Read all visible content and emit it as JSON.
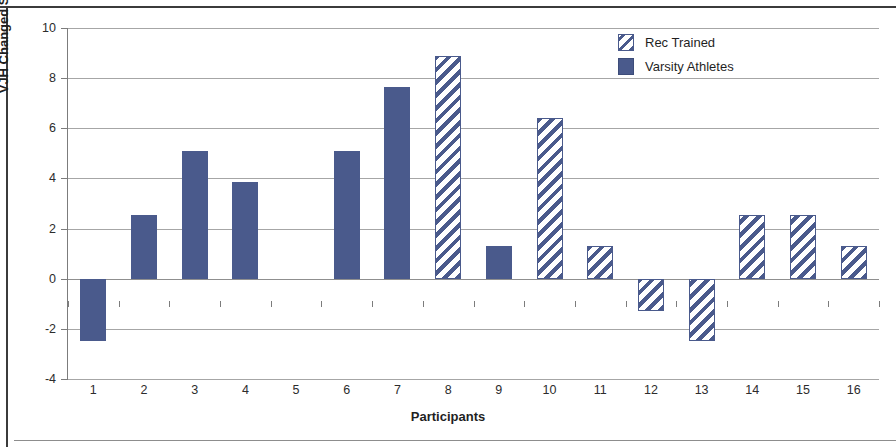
{
  "chart_data": {
    "type": "bar",
    "title": "",
    "xlabel": "Participants",
    "ylabel": "VJH Changed Scores (cm)",
    "categories": [
      "1",
      "2",
      "3",
      "4",
      "5",
      "6",
      "7",
      "8",
      "9",
      "10",
      "11",
      "12",
      "13",
      "14",
      "15",
      "16"
    ],
    "values": [
      -2.5,
      2.55,
      5.1,
      3.85,
      0,
      5.1,
      7.65,
      8.9,
      1.3,
      6.4,
      1.3,
      -1.3,
      -2.5,
      2.55,
      2.55,
      1.3
    ],
    "groups": [
      "Varsity Athletes",
      "Varsity Athletes",
      "Varsity Athletes",
      "Varsity Athletes",
      "Varsity Athletes",
      "Varsity Athletes",
      "Varsity Athletes",
      "Rec Trained",
      "Varsity Athletes",
      "Rec Trained",
      "Rec Trained",
      "Rec Trained",
      "Rec Trained",
      "Rec Trained",
      "Rec Trained",
      "Rec Trained"
    ],
    "ylim": [
      -4,
      10
    ],
    "yticks": [
      10,
      8,
      6,
      4,
      2,
      0,
      -2,
      -4
    ],
    "ytick_labels": [
      "10",
      "8",
      "6",
      "4",
      "2",
      "0",
      "-2",
      "-4"
    ],
    "grid": true,
    "legend_position": "top-right",
    "series": [
      {
        "name": "Rec Trained",
        "pattern": "diagonal-hatch",
        "color": "#4a5a8c",
        "points": [
          {
            "participant": "8",
            "value": 8.9
          },
          {
            "participant": "10",
            "value": 6.4
          },
          {
            "participant": "11",
            "value": 1.3
          },
          {
            "participant": "12",
            "value": -1.3
          },
          {
            "participant": "13",
            "value": -2.5
          },
          {
            "participant": "14",
            "value": 2.55
          },
          {
            "participant": "15",
            "value": 2.55
          },
          {
            "participant": "16",
            "value": 1.3
          }
        ]
      },
      {
        "name": "Varsity Athletes",
        "pattern": "solid",
        "color": "#4a5a8c",
        "points": [
          {
            "participant": "1",
            "value": -2.5
          },
          {
            "participant": "2",
            "value": 2.55
          },
          {
            "participant": "3",
            "value": 5.1
          },
          {
            "participant": "4",
            "value": 3.85
          },
          {
            "participant": "5",
            "value": 0
          },
          {
            "participant": "6",
            "value": 5.1
          },
          {
            "participant": "7",
            "value": 7.65
          },
          {
            "participant": "9",
            "value": 1.3
          }
        ]
      }
    ]
  },
  "legend": {
    "items": [
      {
        "label": "Rec Trained",
        "pattern": "diagonal-hatch"
      },
      {
        "label": "Varsity Athletes",
        "pattern": "solid"
      }
    ]
  },
  "colors": {
    "bar": "#4a5a8c",
    "grid": "#a6a6a6",
    "axis": "#7c7c7c",
    "text": "#1f1f1f",
    "background": "#ffffff"
  }
}
